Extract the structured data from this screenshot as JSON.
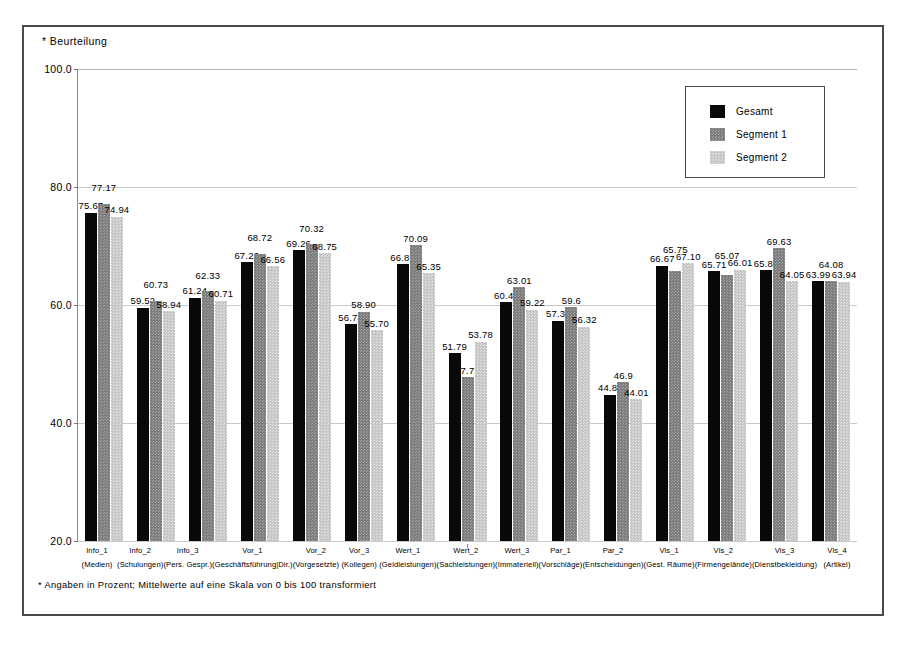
{
  "chart_data": {
    "type": "bar",
    "title": "",
    "ylabel": "* Beurteilung",
    "xlabel": "",
    "ylim": [
      20.0,
      100.0
    ],
    "yticks": [
      "20.0",
      "40.0",
      "60.0",
      "80.0",
      "100.0"
    ],
    "grid": true,
    "legend_position": "top-right",
    "categories": [
      "Info_1",
      "Info_2",
      "Info_3",
      "Vor_1",
      "Vor_2",
      "Vor_3",
      "Wert_1",
      "Wert_2",
      "Wert_3",
      "Par_1",
      "Par_2",
      "Vls_1",
      "Vls_2",
      "Vls_3",
      "Vls_4"
    ],
    "category_descriptions": [
      "(Medien)",
      "(Schulungen)",
      "(Pers. Gespr.)",
      "(Geschäftsführung|Dir.)",
      "(Vorgesetzte)",
      "(Kollegen)",
      "(Geldleistungen)",
      "(Sachleistungen)",
      "(Immateriell)",
      "(Vorschläge)",
      "(Entscheidungen)",
      "(Gest. Räume)",
      "(Firmengelände)",
      "(Dienstbekleidung)",
      "(Artikel)"
    ],
    "series": [
      {
        "name": "Gesamt",
        "color": "#090909",
        "values": [
          75.67,
          59.52,
          61.24,
          67.26,
          69.26,
          56.74,
          66.89,
          51.79,
          60.46,
          57.33,
          44.8,
          66.67,
          65.71,
          65.86,
          63.99
        ],
        "labels": [
          "75.67",
          "59.52",
          "61.24",
          "67.26",
          "69.26",
          "56.74",
          "66.89",
          "51.79",
          "60.46",
          "57.33",
          "44.80",
          "66.67",
          "65.71",
          "65.86",
          "63.99"
        ]
      },
      {
        "name": "Segment 1",
        "color": "#7d7d7d",
        "values": [
          77.17,
          60.73,
          62.33,
          68.72,
          70.32,
          58.9,
          70.09,
          47.72,
          63.01,
          59.6,
          46.9,
          65.75,
          65.07,
          69.63,
          64.08
        ],
        "labels": [
          "77.17",
          "60.73",
          "62.33",
          "68.72",
          "70.32",
          "58.90",
          "70.09",
          "47.72",
          "63.01",
          "59.6",
          "46.9",
          "65.75",
          "65.07",
          "69.63",
          "64.08"
        ]
      },
      {
        "name": "Segment 2",
        "color": "#c6c6c6",
        "values": [
          74.94,
          58.94,
          60.71,
          66.56,
          68.75,
          55.7,
          65.35,
          53.78,
          59.22,
          56.32,
          44.01,
          67.1,
          66.01,
          64.05,
          63.94
        ],
        "labels": [
          "74.94",
          "58.94",
          "60.71",
          "66.56",
          "68.75",
          "55.70",
          "65.35",
          "53.78",
          "59.22",
          "56.32",
          "44.01",
          "67.10",
          "66.01",
          "64.05",
          "63.94"
        ]
      }
    ],
    "footnote": "* Angaben in Prozent; Mittelwerte auf eine Skala von 0 bis 100 transformiert"
  }
}
